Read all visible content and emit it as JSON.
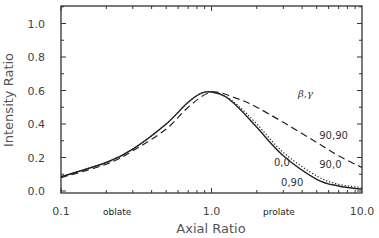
{
  "chart_data": {
    "type": "line",
    "title": "",
    "xlabel": "Axial Ratio",
    "ylabel": "Intensity Ratio",
    "xscale": "log",
    "xlim": [
      0.1,
      10.0
    ],
    "ylim": [
      0.0,
      1.1
    ],
    "x_ticks": [
      "0.1",
      "1.0",
      "10.0"
    ],
    "y_ticks": [
      "0.0",
      "0.2",
      "0.4",
      "0.6",
      "0.8",
      "1.0"
    ],
    "grid": false,
    "legend_title": "β,γ",
    "region_labels": {
      "left": "oblate",
      "right": "prolate"
    },
    "series": [
      {
        "name": "0,0",
        "style": "solid",
        "x": [
          0.1,
          0.2,
          0.3,
          0.5,
          0.7,
          0.9,
          1.2,
          1.5,
          2.0,
          3.0,
          5.0,
          7.0,
          10.0
        ],
        "values": [
          0.085,
          0.17,
          0.25,
          0.4,
          0.53,
          0.59,
          0.57,
          0.5,
          0.38,
          0.21,
          0.07,
          0.03,
          0.01
        ]
      },
      {
        "name": "0,90",
        "style": "dotted",
        "x": [
          0.1,
          0.2,
          0.3,
          0.5,
          0.7,
          0.9,
          1.2,
          1.5,
          2.0,
          3.0,
          5.0,
          7.0,
          10.0
        ],
        "values": [
          0.085,
          0.17,
          0.25,
          0.4,
          0.53,
          0.59,
          0.57,
          0.51,
          0.4,
          0.23,
          0.09,
          0.04,
          0.02
        ]
      },
      {
        "name": "90,90",
        "style": "dashed",
        "x": [
          0.1,
          0.2,
          0.3,
          0.5,
          0.7,
          1.0,
          1.5,
          2.0,
          3.0,
          5.0,
          7.0,
          10.0
        ],
        "values": [
          0.08,
          0.16,
          0.24,
          0.37,
          0.5,
          0.59,
          0.55,
          0.5,
          0.41,
          0.29,
          0.21,
          0.14
        ]
      }
    ],
    "annotations": [
      {
        "text": "90,90",
        "x": 5.2,
        "y": 0.31
      },
      {
        "text": "90,0",
        "x": 5.2,
        "y": 0.14
      },
      {
        "text": "0,0",
        "x": 2.6,
        "y": 0.15
      },
      {
        "text": "0,90",
        "x": 2.9,
        "y": 0.03
      }
    ]
  },
  "caption": "FIG. ..."
}
